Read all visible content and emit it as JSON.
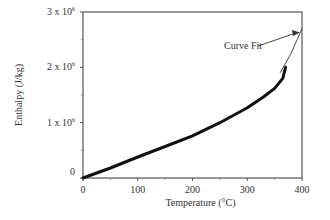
{
  "chart_data": {
    "type": "line",
    "title": "",
    "xlabel": "Temperature (°C)",
    "ylabel": "Enthalpy (J/kg)",
    "xlim": [
      0,
      400
    ],
    "ylim": [
      0,
      3000000
    ],
    "x_ticks": [
      "0",
      "100",
      "200",
      "300",
      "400"
    ],
    "y_ticks": [
      "0",
      "1 x 10⁶",
      "2 x 10⁶",
      "3 x 10⁶"
    ],
    "grid": false,
    "legend": null,
    "annotations": [
      {
        "text": "Curve Fit",
        "arrow_to": [
          400,
          2700000
        ]
      }
    ],
    "series": [
      {
        "name": "Data",
        "style": "thick solid",
        "x": [
          0,
          25,
          50,
          100,
          150,
          200,
          250,
          300,
          330,
          350,
          365,
          370
        ],
        "y": [
          0,
          90000,
          180000,
          380000,
          570000,
          760000,
          1000000,
          1270000,
          1470000,
          1620000,
          1800000,
          2000000
        ]
      },
      {
        "name": "Curve Fit",
        "style": "thin solid",
        "x": [
          360,
          380,
          400
        ],
        "y": [
          1900000,
          2250000,
          2700000
        ]
      }
    ]
  }
}
